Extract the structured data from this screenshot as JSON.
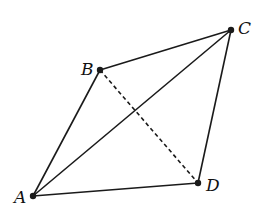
{
  "diagram": {
    "type": "quadrilateral",
    "points": {
      "A": {
        "label": "A",
        "x": 33,
        "y": 196,
        "lx": 14,
        "ly": 203
      },
      "B": {
        "label": "B",
        "x": 100,
        "y": 70,
        "lx": 81,
        "ly": 75
      },
      "C": {
        "label": "C",
        "x": 231,
        "y": 30,
        "lx": 238,
        "ly": 34
      },
      "D": {
        "label": "D",
        "x": 198,
        "y": 183,
        "lx": 206,
        "ly": 191
      }
    },
    "solid_segments": [
      [
        "A",
        "B"
      ],
      [
        "B",
        "C"
      ],
      [
        "C",
        "D"
      ],
      [
        "D",
        "A"
      ],
      [
        "A",
        "C"
      ]
    ],
    "dashed_segments": [
      [
        "B",
        "D"
      ]
    ],
    "stroke_color": "#1a1a1a"
  }
}
